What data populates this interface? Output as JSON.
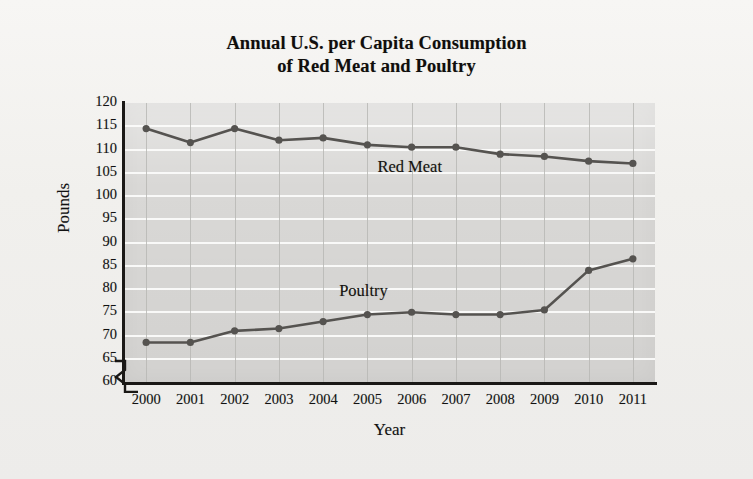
{
  "figure": {
    "title_line1": "Annual U.S. per Capita Consumption",
    "title_line2": "of Red Meat and Poultry",
    "page_background": "#f2f1ef",
    "plot_background": "#d9d8d6",
    "line_color": "#555350",
    "hgrid_color": "#fbfbfa",
    "vgrid_color": "#b9b8b5",
    "axis_color": "#1a1816",
    "axis_break_symbol": "zigzag"
  },
  "chart_data": {
    "type": "line",
    "title": "Annual U.S. per Capita Consumption of Red Meat and Poultry",
    "xlabel": "Year",
    "ylabel": "Pounds",
    "x": [
      2000,
      2001,
      2002,
      2003,
      2004,
      2005,
      2006,
      2007,
      2008,
      2009,
      2010,
      2011
    ],
    "categories": [
      "2000",
      "2001",
      "2002",
      "2003",
      "2004",
      "2005",
      "2006",
      "2007",
      "2008",
      "2009",
      "2010",
      "2011"
    ],
    "ylim": [
      60,
      120
    ],
    "yticks": [
      60,
      65,
      70,
      75,
      80,
      85,
      90,
      95,
      100,
      105,
      110,
      115,
      120
    ],
    "ytick_step": 5,
    "y_axis_broken": true,
    "grid": true,
    "legend": "inline-labels",
    "series": [
      {
        "name": "Red Meat",
        "label_position": "inline-above-line",
        "values": [
          114.5,
          111.5,
          114.5,
          112.0,
          112.5,
          111.0,
          110.5,
          110.5,
          109.0,
          108.5,
          107.5,
          107.0
        ]
      },
      {
        "name": "Poultry",
        "label_position": "inline-above-line",
        "values": [
          68.5,
          68.5,
          71.0,
          71.5,
          73.0,
          74.5,
          75.0,
          74.5,
          74.5,
          75.5,
          84.0,
          86.5
        ]
      }
    ]
  }
}
